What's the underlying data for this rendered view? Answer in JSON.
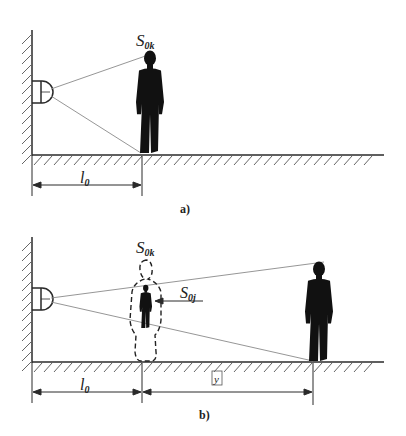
{
  "panel_a": {
    "caption": "a)",
    "label_s": "S",
    "label_s_sub": "0k",
    "label_l": "l",
    "label_l_sub": "0"
  },
  "panel_b": {
    "caption": "b)",
    "label_s": "S",
    "label_s_sub": "0k",
    "label_sj": "S",
    "label_sj_sub": "0j",
    "label_l": "l",
    "label_l_sub": "0",
    "label_y": "y"
  },
  "colors": {
    "line": "#2a2a2a",
    "ray": "#8a8a8a",
    "silhouette": "#111111"
  }
}
